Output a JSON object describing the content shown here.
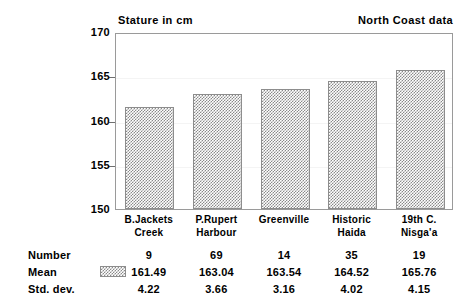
{
  "header": {
    "title_left": "Stature in cm",
    "title_right": "North Coast data"
  },
  "chart_data": {
    "type": "bar",
    "title": "Stature in cm",
    "subtitle": "North Coast data",
    "xlabel": "",
    "ylabel": "Stature in cm",
    "ylim": [
      150,
      170
    ],
    "yticks": [
      150,
      155,
      160,
      165,
      170
    ],
    "ytick_labels": [
      "150",
      "155",
      "160",
      "165",
      "170"
    ],
    "grid": true,
    "legend": "Mean",
    "categories": [
      "B.Jackets Creek",
      "P.Rupert Harbour",
      "Greenville",
      "Historic Haida",
      "19th C. Nisga'a"
    ],
    "category_lines": [
      [
        "B.Jackets",
        "Creek"
      ],
      [
        "P.Rupert",
        "Harbour"
      ],
      [
        "Greenville",
        ""
      ],
      [
        "Historic",
        "Haida"
      ],
      [
        "19th C.",
        "Nisga'a"
      ]
    ],
    "values": [
      161.49,
      163.04,
      163.54,
      164.52,
      165.76
    ],
    "series": [
      {
        "name": "Mean",
        "values": [
          161.49,
          163.04,
          163.54,
          164.52,
          165.76
        ]
      }
    ]
  },
  "table": {
    "row_labels": [
      "Number",
      "Mean",
      "Std. dev."
    ],
    "rows": {
      "number": [
        "9",
        "69",
        "14",
        "35",
        "19"
      ],
      "mean": [
        "161.49",
        "163.04",
        "163.54",
        "164.52",
        "165.76"
      ],
      "std_dev": [
        "4.22",
        "3.66",
        "3.16",
        "4.02",
        "4.15"
      ]
    }
  },
  "colors": {
    "bar_hatch": "#8a8a8a",
    "frame": "#9a9a9a",
    "grid": "#f4f4f4",
    "text": "#000000",
    "background": "#ffffff"
  }
}
